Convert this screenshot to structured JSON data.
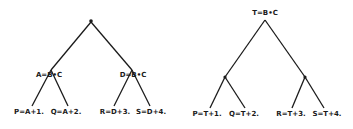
{
  "left_tree": {
    "root": {
      "label": "",
      "x": 91,
      "y": 22
    },
    "mid_nodes": [
      {
        "label": "A=B•C",
        "x": 51,
        "y": 70,
        "text_x": 49,
        "text_y": 77
      },
      {
        "label": "D=B•C",
        "x": 132,
        "y": 70,
        "text_x": 133,
        "text_y": 77
      }
    ],
    "leaves": [
      {
        "label": "P=A+1.",
        "x": 32,
        "y": 106,
        "text_x": 29,
        "text_y": 114
      },
      {
        "label": "Q=A+2.",
        "x": 68,
        "y": 106,
        "text_x": 66,
        "text_y": 114
      },
      {
        "label": "R=D+3.",
        "x": 114,
        "y": 106,
        "text_x": 115,
        "text_y": 114
      },
      {
        "label": "S=D+4.",
        "x": 150,
        "y": 106,
        "text_x": 151,
        "text_y": 114
      }
    ]
  },
  "right_tree": {
    "root": {
      "label": "T=B•C",
      "x": 265,
      "y": 20,
      "text_x": 265,
      "text_y": 15
    },
    "mid_nodes": [
      {
        "label": "",
        "x": 225,
        "y": 77
      },
      {
        "label": "",
        "x": 305,
        "y": 77
      }
    ],
    "leaves": [
      {
        "label": "P=T+1.",
        "x": 210,
        "y": 108,
        "text_x": 207,
        "text_y": 116
      },
      {
        "label": "Q=T+2.",
        "x": 245,
        "y": 108,
        "text_x": 244,
        "text_y": 116
      },
      {
        "label": "R=T+3.",
        "x": 292,
        "y": 108,
        "text_x": 291,
        "text_y": 116
      },
      {
        "label": "S=T+4.",
        "x": 324,
        "y": 108,
        "text_x": 327,
        "text_y": 116
      }
    ]
  },
  "colors": {
    "ink": "#1a1a1a",
    "background": "#ffffff"
  }
}
